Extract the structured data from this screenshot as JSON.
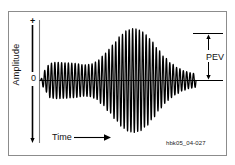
{
  "figure": {
    "id_caption": "hbk05_04-027",
    "border_color": "#8c8c8c",
    "trace_color": "#000000",
    "background": "#ffffff"
  },
  "axes": {
    "y": {
      "title": "Amplitude",
      "top_tick_label": "+",
      "zero_tick_label": "0",
      "axis_line_x": 39,
      "baseline_y": 80
    },
    "x": {
      "title": "Time",
      "arrow_icon": "right-arrow-icon"
    }
  },
  "annotations": {
    "pev": {
      "label": "PEV",
      "description": "peak-envelope-voltage bracket",
      "bracket_top_y": 33,
      "bracket_bottom_y": 80,
      "bracket_x": 208,
      "arrow_icon": "double-headed-vertical-arrow-icon"
    }
  },
  "chart_data": {
    "type": "line",
    "title": "",
    "subtitle": "",
    "xlabel": "Time",
    "ylabel": "Amplitude",
    "grid": false,
    "legend": null,
    "ylim": [
      -1.1,
      1.1
    ],
    "xlim": [
      0,
      1
    ],
    "ytick_labels": [
      "+",
      "0"
    ],
    "carrier_cycles": 46,
    "envelope": {
      "x": [
        0.0,
        0.03,
        0.06,
        0.1,
        0.16,
        0.22,
        0.28,
        0.32,
        0.36,
        0.4,
        0.44,
        0.48,
        0.52,
        0.56,
        0.6,
        0.64,
        0.68,
        0.72,
        0.76,
        0.8,
        0.84,
        0.88,
        0.92,
        0.96,
        1.0
      ],
      "y": [
        0.02,
        0.2,
        0.33,
        0.35,
        0.34,
        0.33,
        0.3,
        0.31,
        0.36,
        0.47,
        0.6,
        0.74,
        0.88,
        0.97,
        1.0,
        0.97,
        0.88,
        0.74,
        0.58,
        0.44,
        0.33,
        0.25,
        0.19,
        0.15,
        0.13
      ]
    },
    "peak": {
      "x": 0.6,
      "y": 1.0,
      "label": "PEV"
    }
  }
}
